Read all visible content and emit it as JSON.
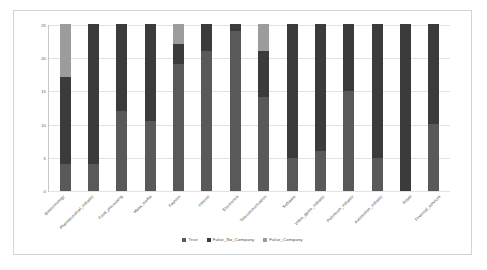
{
  "chart_data": {
    "type": "bar",
    "stacked": true,
    "title": "",
    "xlabel": "",
    "ylabel": "",
    "ylim": [
      0,
      25
    ],
    "yticks": [
      0,
      5,
      10,
      15,
      20,
      25
    ],
    "grid": true,
    "legend_position": "bottom",
    "categories": [
      "Biotechnology",
      "Pharmaceutical_Industry",
      "Food_processing",
      "Mass_media",
      "Fashion",
      "Internet",
      "Electronics",
      "Telecommunication",
      "Software",
      "Video_game_industry",
      "Petroleum_industry",
      "Automotive_industry",
      "Retail",
      "Financial_services"
    ],
    "series": [
      {
        "name": "True",
        "color": "#595959",
        "values": [
          4,
          4,
          12,
          10.5,
          19,
          21,
          24,
          14,
          5,
          6,
          15,
          5,
          0,
          10
        ]
      },
      {
        "name": "False_No_Company",
        "color": "#3b3b3b",
        "values": [
          13,
          21,
          13,
          14.5,
          3,
          4,
          1,
          7,
          20,
          19,
          10,
          20,
          25,
          15
        ]
      },
      {
        "name": "False_Company",
        "color": "#9c9c9c",
        "values": [
          8,
          0,
          0,
          0,
          3,
          0,
          0,
          4,
          0,
          0,
          0,
          0,
          0,
          0
        ]
      }
    ]
  },
  "legend": {
    "items": [
      {
        "label": "True",
        "color": "#595959"
      },
      {
        "label": "False_No_Company",
        "color": "#3b3b3b"
      },
      {
        "label": "False_Company",
        "color": "#9c9c9c"
      }
    ]
  }
}
